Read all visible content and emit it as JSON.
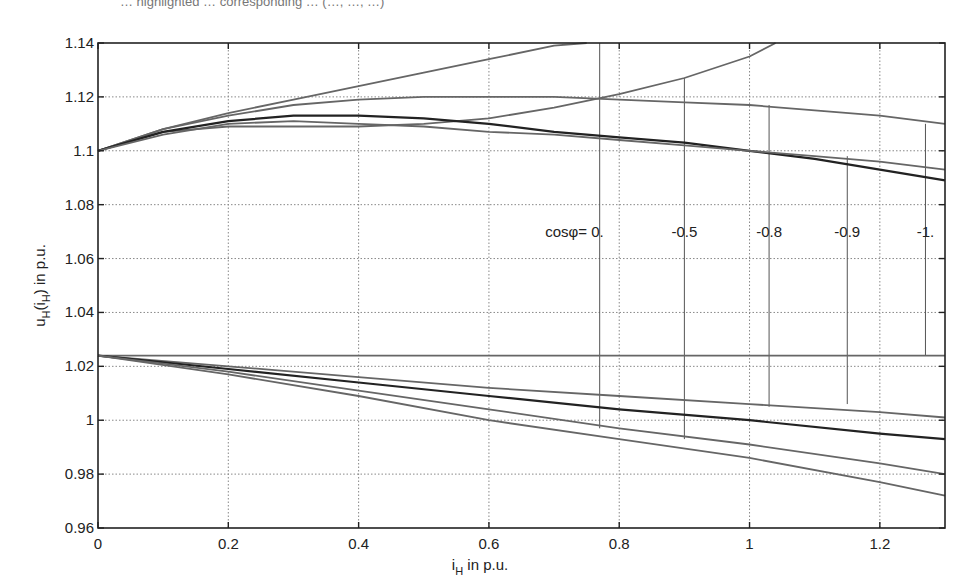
{
  "caption_fragment": "… highlighted … corresponding … (…, …, …)",
  "chart_data": {
    "type": "line",
    "title": "",
    "xlabel": "i_H in p.u.",
    "ylabel": "u_H(i_H) in p.u.",
    "xlim": [
      0,
      1.3
    ],
    "ylim": [
      0.96,
      1.14
    ],
    "grid": true,
    "x_ticks": [
      0,
      0.2,
      0.4,
      0.6,
      0.8,
      1,
      1.2
    ],
    "x_tick_labels": [
      "0",
      "0.2",
      "0.4",
      "0.6",
      "0.8",
      "1",
      "1.2"
    ],
    "y_ticks": [
      0.96,
      0.98,
      1.0,
      1.02,
      1.04,
      1.06,
      1.08,
      1.1,
      1.12,
      1.14
    ],
    "y_tick_labels": [
      "0.96",
      "0.98",
      "1",
      "1.02",
      "1.04",
      "1.06",
      "1.08",
      "1.1",
      "1.12",
      "1.14"
    ],
    "annotations": {
      "prefix": "cosφ=",
      "labels": [
        "0.",
        "-0.5",
        "-0.8",
        "-0.9",
        "-1."
      ],
      "marker_x": [
        0.77,
        0.9,
        1.03,
        1.15,
        1.27
      ]
    },
    "series": [
      {
        "name": "upper cosφ=0 (rising)",
        "group": "upper",
        "color": "#666666",
        "x": [
          0,
          0.1,
          0.2,
          0.3,
          0.4,
          0.5,
          0.6,
          0.7,
          0.75
        ],
        "y": [
          1.1,
          1.108,
          1.114,
          1.119,
          1.124,
          1.129,
          1.134,
          1.139,
          1.14
        ]
      },
      {
        "name": "upper cosφ=-0.5",
        "group": "upper",
        "color": "#666666",
        "x": [
          0,
          0.1,
          0.2,
          0.3,
          0.4,
          0.5,
          0.6,
          0.7,
          0.8,
          0.9,
          1.0,
          1.04
        ],
        "y": [
          1.1,
          1.107,
          1.109,
          1.109,
          1.109,
          1.11,
          1.112,
          1.116,
          1.121,
          1.127,
          1.135,
          1.14
        ]
      },
      {
        "name": "upper cosφ=-0.8",
        "group": "upper",
        "color": "#666666",
        "x": [
          0,
          0.1,
          0.2,
          0.3,
          0.4,
          0.5,
          0.6,
          0.7,
          0.8,
          0.9,
          1.0,
          1.1,
          1.2,
          1.3
        ],
        "y": [
          1.1,
          1.108,
          1.113,
          1.117,
          1.119,
          1.12,
          1.12,
          1.12,
          1.119,
          1.118,
          1.117,
          1.115,
          1.113,
          1.11
        ]
      },
      {
        "name": "upper cosφ=-0.9",
        "group": "upper",
        "color": "#222222",
        "x": [
          0,
          0.1,
          0.2,
          0.3,
          0.4,
          0.5,
          0.6,
          0.7,
          0.8,
          0.9,
          1.0,
          1.1,
          1.2,
          1.3
        ],
        "y": [
          1.1,
          1.107,
          1.111,
          1.113,
          1.113,
          1.112,
          1.11,
          1.107,
          1.105,
          1.103,
          1.1,
          1.097,
          1.093,
          1.089
        ]
      },
      {
        "name": "upper cosφ=-1",
        "group": "upper",
        "color": "#666666",
        "x": [
          0,
          0.1,
          0.2,
          0.3,
          0.4,
          0.5,
          0.6,
          0.7,
          0.8,
          0.9,
          1.0,
          1.1,
          1.2,
          1.3
        ],
        "y": [
          1.1,
          1.106,
          1.11,
          1.111,
          1.11,
          1.109,
          1.107,
          1.106,
          1.104,
          1.102,
          1.1,
          1.098,
          1.096,
          1.093
        ]
      },
      {
        "name": "reference level",
        "group": "lower",
        "color": "#666666",
        "x": [
          0,
          1.3
        ],
        "y": [
          1.024,
          1.024
        ]
      },
      {
        "name": "lower cosφ=0",
        "group": "lower",
        "color": "#666666",
        "x": [
          0,
          0.2,
          0.4,
          0.6,
          0.8,
          1.0,
          1.2,
          1.3
        ],
        "y": [
          1.024,
          1.02,
          1.016,
          1.012,
          1.009,
          1.006,
          1.003,
          1.001
        ]
      },
      {
        "name": "lower cosφ=-0.5",
        "group": "lower",
        "color": "#222222",
        "x": [
          0,
          0.2,
          0.4,
          0.6,
          0.8,
          1.0,
          1.2,
          1.3
        ],
        "y": [
          1.024,
          1.019,
          1.014,
          1.009,
          1.004,
          1.0,
          0.995,
          0.993
        ]
      },
      {
        "name": "lower cosφ=-0.8",
        "group": "lower",
        "color": "#666666",
        "x": [
          0,
          0.2,
          0.4,
          0.6,
          0.8,
          1.0,
          1.2,
          1.3
        ],
        "y": [
          1.024,
          1.018,
          1.011,
          1.004,
          0.997,
          0.991,
          0.984,
          0.98
        ]
      },
      {
        "name": "lower cosφ=-1",
        "group": "lower",
        "color": "#666666",
        "x": [
          0,
          0.2,
          0.4,
          0.6,
          0.8,
          1.0,
          1.2,
          1.3
        ],
        "y": [
          1.024,
          1.017,
          1.009,
          1.0,
          0.993,
          0.986,
          0.977,
          0.972
        ]
      }
    ],
    "marker_segments": [
      {
        "x": 0.77,
        "y_top": 1.14,
        "y_bottom": 1.024
      },
      {
        "x": 0.9,
        "y_top": 1.127,
        "y_bottom": 1.024
      },
      {
        "x": 1.03,
        "y_top": 1.117,
        "y_bottom": 1.024
      },
      {
        "x": 1.15,
        "y_top": 1.098,
        "y_bottom": 1.024
      },
      {
        "x": 1.27,
        "y_top": 1.11,
        "y_bottom": 1.024
      },
      {
        "x": 0.77,
        "y_top": 1.024,
        "y_bottom": 0.997
      },
      {
        "x": 0.9,
        "y_top": 1.024,
        "y_bottom": 0.993
      },
      {
        "x": 1.03,
        "y_top": 1.024,
        "y_bottom": 1.005
      },
      {
        "x": 1.15,
        "y_top": 1.024,
        "y_bottom": 1.006
      }
    ]
  }
}
